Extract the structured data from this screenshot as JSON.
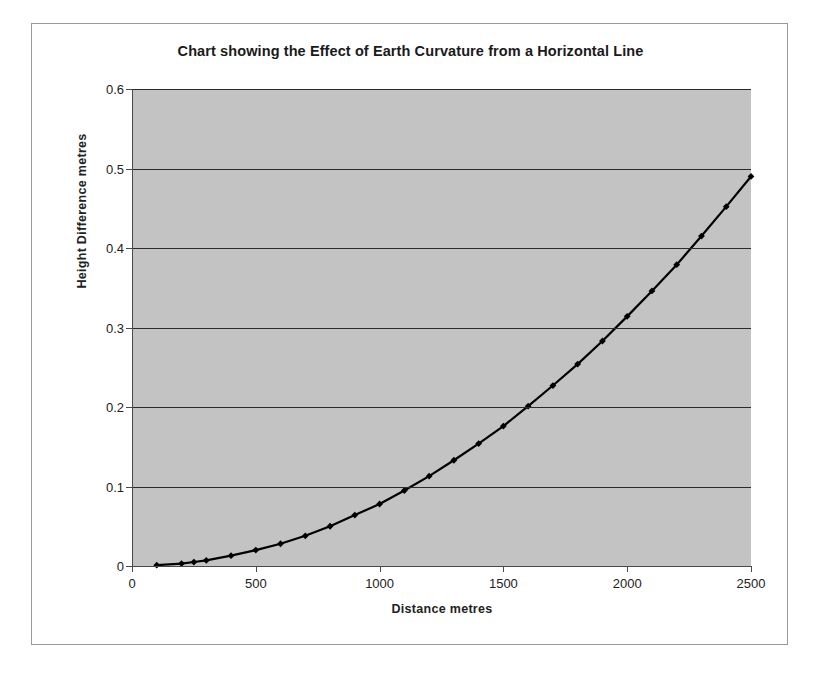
{
  "chart_data": {
    "type": "line",
    "title": "Chart showing the Effect of Earth Curvature from a Horizontal Line",
    "xlabel": "Distance  metres",
    "ylabel": "Height Difference  metres",
    "xlim": [
      0,
      2500
    ],
    "ylim": [
      0,
      0.6
    ],
    "xticks": [
      0,
      500,
      1000,
      1500,
      2000,
      2500
    ],
    "xtick_labels": [
      "0",
      "500",
      "1000",
      "1500",
      "2000",
      "2500"
    ],
    "yticks": [
      0,
      0.1,
      0.2,
      0.3,
      0.4,
      0.5,
      0.6
    ],
    "ytick_labels": [
      "0",
      "0.1",
      "0.2",
      "0.3",
      "0.4",
      "0.5",
      "0.6"
    ],
    "grid": "horizontal",
    "legend": "none",
    "marker": "diamond",
    "line_color": "#000000",
    "marker_color": "#000000",
    "plot_background": "#c3c3c3",
    "gridline_color": "#2b2b2b",
    "x": [
      100,
      200,
      250,
      300,
      400,
      500,
      600,
      700,
      800,
      900,
      1000,
      1100,
      1200,
      1300,
      1400,
      1500,
      1600,
      1700,
      1800,
      1900,
      2000,
      2100,
      2200,
      2300,
      2400,
      2500
    ],
    "values": [
      0.001,
      0.003,
      0.005,
      0.007,
      0.013,
      0.02,
      0.028,
      0.038,
      0.05,
      0.064,
      0.078,
      0.095,
      0.113,
      0.133,
      0.154,
      0.176,
      0.201,
      0.227,
      0.254,
      0.283,
      0.314,
      0.346,
      0.379,
      0.415,
      0.452,
      0.49
    ],
    "series": [
      {
        "name": "Height Difference",
        "values": [
          0.001,
          0.003,
          0.005,
          0.007,
          0.013,
          0.02,
          0.028,
          0.038,
          0.05,
          0.064,
          0.078,
          0.095,
          0.113,
          0.133,
          0.154,
          0.176,
          0.201,
          0.227,
          0.254,
          0.283,
          0.314,
          0.346,
          0.379,
          0.415,
          0.452,
          0.49
        ]
      }
    ]
  }
}
